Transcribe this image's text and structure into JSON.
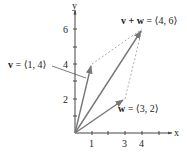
{
  "diagram": {
    "type": "vector-addition-parallelogram",
    "axes": {
      "x_label": "x",
      "y_label": "y",
      "x_ticks": [
        {
          "value": 1,
          "label": "1"
        },
        {
          "value": 2,
          "label": ""
        },
        {
          "value": 3,
          "label": "3"
        },
        {
          "value": 4,
          "label": "4"
        },
        {
          "value": 5,
          "label": ""
        },
        {
          "value": 6,
          "label": ""
        }
      ],
      "y_ticks": [
        {
          "value": 1,
          "label": ""
        },
        {
          "value": 2,
          "label": "2"
        },
        {
          "value": 3,
          "label": ""
        },
        {
          "value": 4,
          "label": "4"
        },
        {
          "value": 5,
          "label": ""
        },
        {
          "value": 6,
          "label": "6"
        }
      ]
    },
    "vectors": {
      "v": {
        "name": "v",
        "equals": "= ⟨1, 4⟩",
        "components": [
          1,
          4
        ]
      },
      "w": {
        "name": "w",
        "equals": "= ⟨3, 2⟩",
        "components": [
          3,
          2
        ]
      },
      "sum": {
        "name": "v + w",
        "equals": "= ⟨4, 6⟩",
        "components": [
          4,
          6
        ]
      }
    },
    "colors": {
      "axis": "#444444",
      "vector": "#777777",
      "dashed": "#999999",
      "text": "#222222"
    }
  }
}
